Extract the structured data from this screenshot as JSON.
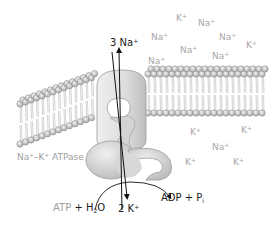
{
  "colors": {
    "background": "#ffffff",
    "membrane_head": "#c9c9c9",
    "membrane_head_stroke": "#8a8a8a",
    "protein": "#d9d9d9",
    "protein_stroke": "#9a9a9a",
    "arrow": "#111111",
    "ion_label": "#a8a8a8",
    "dark_label": "#1a1a1a"
  },
  "labels": {
    "enzyme": {
      "text": "Na⁺–K⁺ ATPase"
    },
    "na_out": {
      "count": "3",
      "ion": "Na",
      "charge": "+"
    },
    "k_in": {
      "count": "2",
      "ion": "K",
      "charge": "+"
    },
    "atp": {
      "text": "ATP",
      "plus": "+",
      "water_h": "H",
      "water_sub": "2",
      "water_o": "O"
    },
    "adp": {
      "text": "ADP + P",
      "sub": "i"
    }
  },
  "extracellular_ions": [
    {
      "ion": "K",
      "charge": "+",
      "x": 176,
      "y": 13
    },
    {
      "ion": "Na",
      "charge": "+",
      "x": 198,
      "y": 18
    },
    {
      "ion": "Na",
      "charge": "+",
      "x": 151,
      "y": 32
    },
    {
      "ion": "Na",
      "charge": "+",
      "x": 219,
      "y": 32
    },
    {
      "ion": "K",
      "charge": "+",
      "x": 246,
      "y": 40
    },
    {
      "ion": "Na",
      "charge": "+",
      "x": 180,
      "y": 45
    },
    {
      "ion": "Na",
      "charge": "+",
      "x": 212,
      "y": 51
    },
    {
      "ion": "Na",
      "charge": "+",
      "x": 148,
      "y": 56
    }
  ],
  "intracellular_ions": [
    {
      "ion": "K",
      "charge": "+",
      "x": 190,
      "y": 127
    },
    {
      "ion": "K",
      "charge": "+",
      "x": 241,
      "y": 125
    },
    {
      "ion": "Na",
      "charge": "+",
      "x": 212,
      "y": 142
    },
    {
      "ion": "K",
      "charge": "+",
      "x": 185,
      "y": 157
    },
    {
      "ion": "K",
      "charge": "+",
      "x": 233,
      "y": 157
    }
  ]
}
